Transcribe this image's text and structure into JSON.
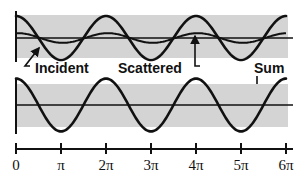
{
  "labels": {
    "incident": "Incident",
    "scattered": "Scattered",
    "sum": "Sum"
  },
  "axis": {
    "ticks": [
      "0",
      "π",
      "2π",
      "3π",
      "4π",
      "5π",
      "6π"
    ]
  },
  "colors": {
    "band": "#d4d4d4",
    "line": "#111111"
  },
  "chart_data": {
    "type": "line",
    "title": "",
    "xlabel": "",
    "ylabel": "",
    "x_ticks": [
      "0",
      "π",
      "2π",
      "3π",
      "4π",
      "5π",
      "6π"
    ],
    "xlim": [
      0,
      "6π"
    ],
    "panels": [
      {
        "name": "top",
        "series": [
          {
            "name": "Incident",
            "function": "cos(x)",
            "amplitude": 1.0
          },
          {
            "name": "Scattered",
            "function": "cos(x)",
            "amplitude": 0.22
          }
        ]
      },
      {
        "name": "bottom",
        "series": [
          {
            "name": "Sum",
            "function": "cos(x)",
            "amplitude": 1.2
          }
        ]
      }
    ],
    "grid": false,
    "shaded_bands": true
  }
}
